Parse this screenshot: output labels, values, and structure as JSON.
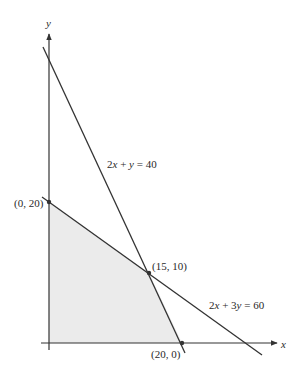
{
  "diagram": {
    "type": "linear-programming-feasible-region",
    "axes": {
      "x_label": "x",
      "y_label": "y"
    },
    "lines": [
      {
        "equation": "2x + y = 40",
        "label_parts": [
          "2",
          "x",
          " + ",
          "y",
          " = 40"
        ]
      },
      {
        "equation": "2x + 3y = 60",
        "label_parts": [
          "2",
          "x",
          " + 3",
          "y",
          " = 60"
        ]
      }
    ],
    "vertices": [
      {
        "label": "(0, 20)"
      },
      {
        "label": "(15, 10)"
      },
      {
        "label": "(20, 0)"
      }
    ],
    "feasible_region": {
      "vertices": [
        "(0, 0)",
        "(0, 20)",
        "(15, 10)",
        "(20, 0)"
      ],
      "fill": "#ebebeb"
    },
    "colors": {
      "line": "#333333",
      "region": "#ebebeb",
      "text": "#2a2a2a"
    }
  }
}
